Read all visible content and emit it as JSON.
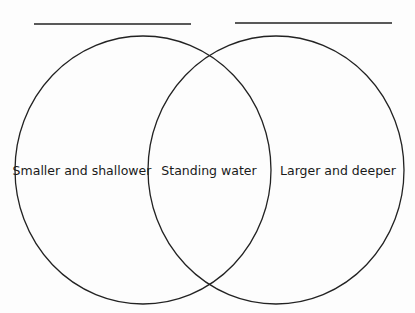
{
  "diagram": {
    "type": "venn",
    "left_title_blank": "",
    "right_title_blank": "",
    "regions": {
      "left": "Smaller and shallower",
      "overlap": "Standing water",
      "right": "Larger and deeper"
    },
    "colors": {
      "stroke": "#222222",
      "background": "#fdfdfd"
    }
  }
}
